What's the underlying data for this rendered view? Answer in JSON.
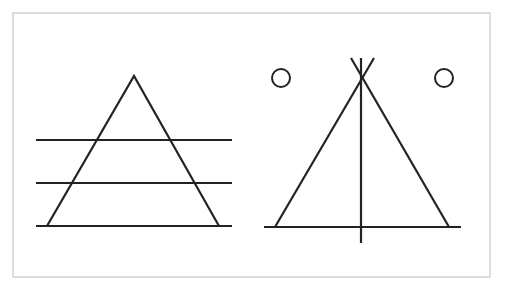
{
  "diagram": {
    "colors": {
      "background": "#ffffff",
      "frame": "#c8c8c8",
      "stroke": "#222222"
    },
    "frame": {
      "x": 13,
      "y": 13,
      "width": 477,
      "height": 264
    },
    "left_figure": {
      "label": "triangle-with-horizontal-lines",
      "triangle": {
        "apex": [
          134,
          76
        ],
        "base_left": [
          47,
          226
        ],
        "base_right": [
          219,
          226
        ]
      },
      "horizontal_lines": [
        {
          "y": 140,
          "x1": 36,
          "x2": 232
        },
        {
          "y": 183,
          "x1": 36,
          "x2": 232
        },
        {
          "y": 226,
          "x1": 36,
          "x2": 232
        }
      ]
    },
    "right_figure": {
      "label": "tipi-figure",
      "triangle": {
        "apex": [
          362,
          78
        ],
        "base_left": [
          275,
          227
        ],
        "base_right": [
          449,
          227
        ]
      },
      "pole_tips": {
        "left": [
          351,
          58
        ],
        "right": [
          374,
          58
        ]
      },
      "vertical_line": {
        "x": 361,
        "y1": 58,
        "y2": 243
      },
      "base_line": {
        "y": 227,
        "x1": 264,
        "x2": 461
      },
      "circles": [
        {
          "cx": 281,
          "cy": 78,
          "r": 9
        },
        {
          "cx": 444,
          "cy": 78,
          "r": 9
        }
      ]
    }
  }
}
